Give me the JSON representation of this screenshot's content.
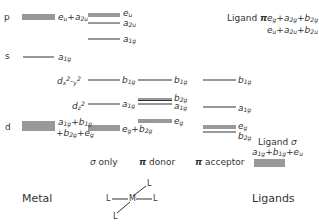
{
  "diagram": {
    "metal": {
      "label": "Metal",
      "orbitals": [
        {
          "name": "p",
          "symmetry": "e_u + a_2u"
        },
        {
          "name": "s",
          "symmetry": "a_1g"
        },
        {
          "name": "d",
          "symmetry": "a_1g + b_1g + b_2g + e_g"
        }
      ]
    },
    "columns": [
      {
        "label": "σ only",
        "levels": [
          "e_u",
          "a_2u",
          "a_1g",
          "b_1g",
          "a_1g",
          "e_g + b_2g"
        ]
      },
      {
        "label": "π donor",
        "levels": [
          "b_1g",
          "b_2g",
          "a_1g",
          "e_g"
        ]
      },
      {
        "label": "π acceptor",
        "levels": [
          "b_1g",
          "a_1g",
          "e_g",
          "b_2g"
        ]
      }
    ],
    "d_labels": [
      "d_x²-y²",
      "d_z²"
    ],
    "ligands": {
      "label": "Ligands",
      "pi": {
        "title": "Ligand π",
        "line1": "e_g + a_2g + b_2g",
        "line2": "e_u + a_2u + b_2u"
      },
      "sigma": {
        "title": "Ligand σ",
        "line1": "a_1g + b_1g + e_u"
      }
    },
    "structure": {
      "center": "M",
      "ligand": "L"
    }
  }
}
